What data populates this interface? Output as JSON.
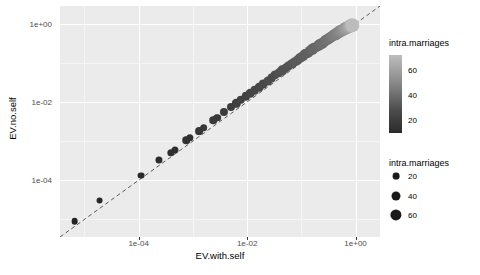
{
  "chart_data": {
    "type": "scatter",
    "title": "",
    "xlabel": "EV.with.self",
    "ylabel": "EV.no.self",
    "xscale": "log10",
    "yscale": "log10",
    "xlim": [
      -5.45,
      0.45
    ],
    "ylim": [
      -5.45,
      0.45
    ],
    "xticks": [
      -4,
      -2,
      0
    ],
    "xticklabels": [
      "1e-04",
      "1e-02",
      "1e+00"
    ],
    "yticks": [
      -4,
      -2,
      0
    ],
    "yticklabels": [
      "1e-04",
      "1e-02",
      "1e+00"
    ],
    "grid": true,
    "grid_major_color": "#ffffff",
    "grid_minor_color": "#f5f5f5",
    "panel_background": "#ebebeb",
    "reference_line": {
      "style": "dashed",
      "slope": 1,
      "intercept": 0,
      "color": "#5a5a5a",
      "label": "identity"
    },
    "legends": [
      {
        "kind": "colorbar",
        "title": "intra.marriages",
        "ticks": [
          20,
          40,
          60
        ],
        "ticklabels": [
          "20",
          "40",
          "60"
        ],
        "low_color": "#2b2b2b",
        "high_color": "#bdbdbd",
        "position": "right"
      },
      {
        "kind": "size",
        "title": "intra.marriages",
        "breaks": [
          20,
          40,
          60
        ],
        "breaklabels": [
          "20",
          "40",
          "60"
        ],
        "radii_px": [
          3.4,
          4.5,
          5.6
        ],
        "color": "#1a1a1a",
        "position": "right"
      }
    ],
    "points": [
      {
        "x": -5.18,
        "y": -5.05,
        "size": 8,
        "color": 8
      },
      {
        "x": -4.72,
        "y": -4.52,
        "size": 9,
        "color": 9
      },
      {
        "x": -3.95,
        "y": -3.88,
        "size": 9,
        "color": 10
      },
      {
        "x": -3.62,
        "y": -3.48,
        "size": 10,
        "color": 11
      },
      {
        "x": -3.4,
        "y": -3.3,
        "size": 11,
        "color": 12
      },
      {
        "x": -3.33,
        "y": -3.22,
        "size": 10,
        "color": 12
      },
      {
        "x": -3.12,
        "y": -2.98,
        "size": 12,
        "color": 13
      },
      {
        "x": -3.05,
        "y": -2.92,
        "size": 11,
        "color": 13
      },
      {
        "x": -2.88,
        "y": -2.74,
        "size": 14,
        "color": 15
      },
      {
        "x": -2.8,
        "y": -2.66,
        "size": 13,
        "color": 15
      },
      {
        "x": -2.62,
        "y": -2.47,
        "size": 12,
        "color": 16
      },
      {
        "x": -2.55,
        "y": -2.4,
        "size": 13,
        "color": 16
      },
      {
        "x": -2.42,
        "y": -2.26,
        "size": 16,
        "color": 18
      },
      {
        "x": -2.3,
        "y": -2.14,
        "size": 15,
        "color": 18
      },
      {
        "x": -2.2,
        "y": -2.04,
        "size": 17,
        "color": 19
      },
      {
        "x": -2.12,
        "y": -1.95,
        "size": 18,
        "color": 20
      },
      {
        "x": -2.02,
        "y": -1.86,
        "size": 17,
        "color": 20
      },
      {
        "x": -1.94,
        "y": -1.78,
        "size": 19,
        "color": 21
      },
      {
        "x": -1.86,
        "y": -1.7,
        "size": 20,
        "color": 22
      },
      {
        "x": -1.78,
        "y": -1.62,
        "size": 19,
        "color": 22
      },
      {
        "x": -1.7,
        "y": -1.54,
        "size": 21,
        "color": 23
      },
      {
        "x": -1.62,
        "y": -1.46,
        "size": 22,
        "color": 24
      },
      {
        "x": -1.55,
        "y": -1.39,
        "size": 21,
        "color": 24
      },
      {
        "x": -1.48,
        "y": -1.32,
        "size": 23,
        "color": 25
      },
      {
        "x": -1.41,
        "y": -1.25,
        "size": 24,
        "color": 26
      },
      {
        "x": -1.35,
        "y": -1.19,
        "size": 25,
        "color": 27
      },
      {
        "x": -1.29,
        "y": -1.13,
        "size": 24,
        "color": 27
      },
      {
        "x": -1.23,
        "y": -1.07,
        "size": 26,
        "color": 28
      },
      {
        "x": -1.17,
        "y": -1.02,
        "size": 27,
        "color": 29
      },
      {
        "x": -1.12,
        "y": -0.97,
        "size": 28,
        "color": 30
      },
      {
        "x": -1.07,
        "y": -0.92,
        "size": 27,
        "color": 30
      },
      {
        "x": -1.02,
        "y": -0.87,
        "size": 29,
        "color": 31
      },
      {
        "x": -0.97,
        "y": -0.83,
        "size": 30,
        "color": 32
      },
      {
        "x": -0.93,
        "y": -0.78,
        "size": 31,
        "color": 33
      },
      {
        "x": -0.88,
        "y": -0.74,
        "size": 30,
        "color": 33
      },
      {
        "x": -0.84,
        "y": -0.7,
        "size": 32,
        "color": 34
      },
      {
        "x": -0.8,
        "y": -0.66,
        "size": 33,
        "color": 35
      },
      {
        "x": -0.76,
        "y": -0.62,
        "size": 34,
        "color": 36
      },
      {
        "x": -0.72,
        "y": -0.59,
        "size": 33,
        "color": 36
      },
      {
        "x": -0.68,
        "y": -0.55,
        "size": 35,
        "color": 37
      },
      {
        "x": -0.65,
        "y": -0.52,
        "size": 36,
        "color": 38
      },
      {
        "x": -0.61,
        "y": -0.49,
        "size": 37,
        "color": 39
      },
      {
        "x": -0.58,
        "y": -0.46,
        "size": 36,
        "color": 39
      },
      {
        "x": -0.55,
        "y": -0.43,
        "size": 38,
        "color": 40
      },
      {
        "x": -0.51,
        "y": -0.4,
        "size": 39,
        "color": 41
      },
      {
        "x": -0.48,
        "y": -0.37,
        "size": 40,
        "color": 42
      },
      {
        "x": -0.45,
        "y": -0.34,
        "size": 41,
        "color": 43
      },
      {
        "x": -0.42,
        "y": -0.32,
        "size": 42,
        "color": 44
      },
      {
        "x": -0.39,
        "y": -0.29,
        "size": 43,
        "color": 45
      },
      {
        "x": -0.36,
        "y": -0.27,
        "size": 44,
        "color": 46
      },
      {
        "x": -0.34,
        "y": -0.25,
        "size": 45,
        "color": 47
      },
      {
        "x": -0.31,
        "y": -0.22,
        "size": 46,
        "color": 48
      },
      {
        "x": -0.28,
        "y": -0.2,
        "size": 48,
        "color": 50
      },
      {
        "x": -0.26,
        "y": -0.18,
        "size": 49,
        "color": 51
      },
      {
        "x": -0.23,
        "y": -0.16,
        "size": 51,
        "color": 53
      },
      {
        "x": -0.21,
        "y": -0.14,
        "size": 53,
        "color": 55
      },
      {
        "x": -0.18,
        "y": -0.12,
        "size": 55,
        "color": 57
      },
      {
        "x": -0.16,
        "y": -0.1,
        "size": 57,
        "color": 59
      },
      {
        "x": -0.13,
        "y": -0.08,
        "size": 60,
        "color": 62
      },
      {
        "x": -0.11,
        "y": -0.07,
        "size": 63,
        "color": 65
      },
      {
        "x": -0.06,
        "y": -0.04,
        "size": 70,
        "color": 72
      }
    ]
  }
}
